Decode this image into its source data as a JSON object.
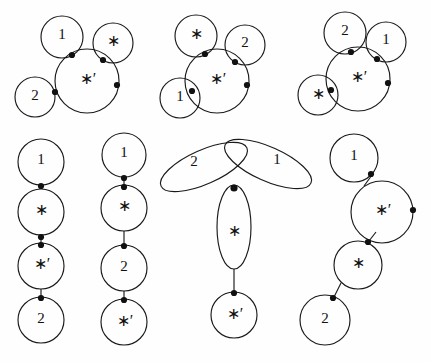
{
  "figure": {
    "background_color": "#fefefe",
    "stroke_color": "#1a1a1a",
    "dot_color": "#111111",
    "width": 431,
    "height": 363,
    "labels": {
      "one": "1",
      "two": "2",
      "star": "∗",
      "star_prime": "∗′"
    },
    "diagrams": [
      {
        "id": "diagram-1",
        "kind": "tangent-cluster",
        "position": "top-left",
        "center_label": "∗′",
        "satellites": [
          {
            "label": "1",
            "placement": "upper-left"
          },
          {
            "label": "∗",
            "placement": "upper-right"
          },
          {
            "label": "2",
            "placement": "lower-left"
          }
        ],
        "free_node_count": 1,
        "node_count": 4
      },
      {
        "id": "diagram-2",
        "kind": "tangent-cluster",
        "position": "top-center",
        "center_label": "∗′",
        "satellites": [
          {
            "label": "∗",
            "placement": "upper-left"
          },
          {
            "label": "2",
            "placement": "upper-right"
          },
          {
            "label": "1",
            "placement": "lower-left"
          }
        ],
        "free_node_count": 1,
        "node_count": 4
      },
      {
        "id": "diagram-3",
        "kind": "tangent-cluster",
        "position": "top-right",
        "center_label": "∗′",
        "satellites": [
          {
            "label": "2",
            "placement": "upper-left"
          },
          {
            "label": "1",
            "placement": "upper-right"
          },
          {
            "label": "∗",
            "placement": "lower-left"
          }
        ],
        "free_node_count": 1,
        "node_count": 4
      },
      {
        "id": "diagram-4",
        "kind": "vertical-chain",
        "position": "bottom-left",
        "chain": [
          "1",
          "∗",
          "∗′",
          "2"
        ],
        "node_count": 3
      },
      {
        "id": "diagram-5",
        "kind": "vertical-chain",
        "position": "bottom-left-center",
        "chain": [
          "1",
          "∗",
          "2",
          "∗′"
        ],
        "node_count": 3
      },
      {
        "id": "diagram-6",
        "kind": "trefoil",
        "position": "bottom-center",
        "petals": [
          {
            "label": "2",
            "placement": "upper-left"
          },
          {
            "label": "1",
            "placement": "upper-right"
          },
          {
            "label": "∗",
            "placement": "lower"
          }
        ],
        "tail_label": "∗′",
        "node_count": 2
      },
      {
        "id": "diagram-7",
        "kind": "diagonal-chain",
        "position": "bottom-right",
        "chain": [
          "1",
          "∗′",
          "∗",
          "2"
        ],
        "free_node_count": 1,
        "node_count": 4
      }
    ]
  }
}
